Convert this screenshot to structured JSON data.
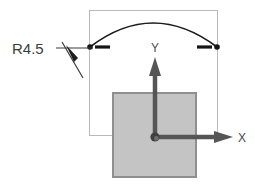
{
  "drawing": {
    "title": "Arc radius dimension with XY coordinate system",
    "background_color": "#ffffff"
  },
  "dimension": {
    "label": "R4.5",
    "radius_value": 4.5,
    "prefix": "R",
    "text_color": "#3c3c3c",
    "leader_color": "#3a3a3a",
    "leader_start_x": 56,
    "leader_start_y": 48,
    "leader_end_x": 92,
    "leader_end_y": 48,
    "arrow_tail_x": 81,
    "arrow_tail_y": 75,
    "arrow_tip_x": 68,
    "arrow_tip_y": 53
  },
  "arc": {
    "name": "radius-arc",
    "color": "#1a1a1a",
    "stroke_width": 1.6,
    "start_x": 90,
    "start_y": 47,
    "end_x": 217,
    "end_y": 47,
    "peak_x": 153,
    "peak_y": 23,
    "control_x": 153,
    "control_y": 0
  },
  "arc_endpoints": [
    {
      "name": "arc-endpoint-left",
      "cx": 90,
      "cy": 47,
      "r": 2.6,
      "color": "#141414",
      "tick_x1": 95,
      "tick_x2": 110,
      "tick_y": 47
    },
    {
      "name": "arc-endpoint-right",
      "cx": 217,
      "cy": 47,
      "r": 2.6,
      "color": "#141414",
      "tick_x1": 197,
      "tick_x2": 212,
      "tick_y": 47
    }
  ],
  "bounding_rect": {
    "name": "construction-boundary",
    "x": 89,
    "y": 10,
    "width": 129,
    "height": 126,
    "stroke": "#b9b9b9",
    "stroke_width": 1
  },
  "part_rect": {
    "name": "part-body",
    "x": 112,
    "y": 92,
    "width": 84,
    "height": 85,
    "fill": "#c4c4c4",
    "stroke": "#8f8f8f",
    "stroke_width": 2
  },
  "origin": {
    "name": "origin-marker",
    "cx": 155,
    "cy": 137,
    "r": 4.2,
    "fill": "#3f3f3f",
    "highlight_fill": "#6e6e6e"
  },
  "axes": [
    {
      "name": "y-axis",
      "label": "Y",
      "direction": "up",
      "color": "#555555",
      "shaft_width": 4,
      "x1": 155,
      "y1": 137,
      "x2": 155,
      "y2": 60,
      "arrow_half_width": 6,
      "arrow_length": 17,
      "label_x": 152,
      "label_y": 51
    },
    {
      "name": "x-axis",
      "label": "X",
      "direction": "right",
      "color": "#555555",
      "shaft_width": 4,
      "x1": 155,
      "y1": 137,
      "x2": 232,
      "y2": 137,
      "arrow_half_width": 6,
      "arrow_length": 17,
      "label_x": 238,
      "label_y": 142
    }
  ]
}
